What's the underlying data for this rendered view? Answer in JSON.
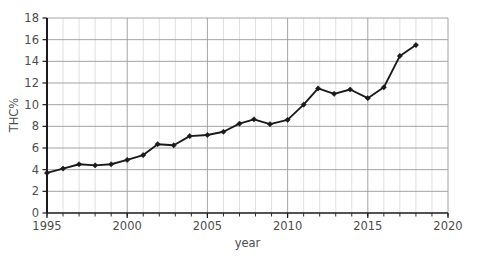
{
  "chart_data": {
    "type": "line",
    "title": "",
    "xlabel": "year",
    "ylabel": "THC%",
    "xlim": [
      1995,
      2020
    ],
    "ylim": [
      0,
      18
    ],
    "grid": true,
    "legend": false,
    "x_ticks": [
      1995,
      2000,
      2005,
      2010,
      2015,
      2020
    ],
    "x_tick_labels": [
      "1995",
      "2000",
      "2005",
      "2010",
      "2015",
      "2020"
    ],
    "x_minor_tick_step": 1,
    "y_ticks": [
      0,
      2,
      4,
      6,
      8,
      10,
      12,
      14,
      16,
      18
    ],
    "y_tick_labels": [
      "0",
      "2",
      "4",
      "6",
      "8",
      "10",
      "12",
      "14",
      "16",
      "18"
    ],
    "series": [
      {
        "name": "THC%",
        "color": "#1a1a1a",
        "marker": "diamond",
        "x": [
          1995.0,
          1996.0,
          1997.0,
          1998.0,
          1999.0,
          2000.0,
          2001.0,
          2001.9,
          2002.9,
          2003.9,
          2005.0,
          2006.0,
          2007.0,
          2007.9,
          2008.9,
          2010.0,
          2011.0,
          2011.9,
          2012.9,
          2013.9,
          2015.0,
          2016.0,
          2017.0,
          2018.0
        ],
        "values": [
          3.7,
          4.1,
          4.5,
          4.4,
          4.5,
          4.9,
          5.35,
          6.35,
          6.25,
          7.1,
          7.2,
          7.5,
          8.25,
          8.65,
          8.2,
          8.6,
          10.0,
          11.5,
          11.0,
          11.4,
          10.6,
          11.6,
          14.5,
          15.5
        ]
      }
    ]
  },
  "axes": {
    "y_axis_title": "THC%",
    "x_axis_title": "year"
  }
}
